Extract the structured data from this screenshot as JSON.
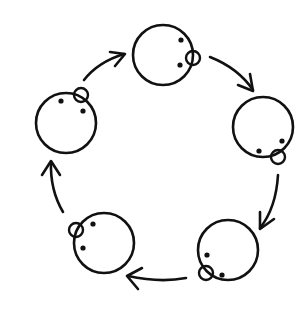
{
  "diagram": {
    "type": "cycle",
    "direction": "clockwise",
    "colors": {
      "stroke": "#111111",
      "background": "#ffffff"
    },
    "nodes": [
      {
        "id": "head-top",
        "cx": 163,
        "cy": 55,
        "r": 30,
        "bump": {
          "cx": 193,
          "cy": 58,
          "r": 7
        },
        "dots": [
          [
            181,
            40
          ],
          [
            180,
            65
          ]
        ]
      },
      {
        "id": "head-right",
        "cx": 263,
        "cy": 127,
        "r": 30,
        "bump": {
          "cx": 278,
          "cy": 157,
          "r": 7
        },
        "dots": [
          [
            259,
            151
          ],
          [
            282,
            141
          ]
        ]
      },
      {
        "id": "head-bottom-right",
        "cx": 228,
        "cy": 250,
        "r": 30,
        "bump": {
          "cx": 206,
          "cy": 273,
          "r": 7
        },
        "dots": [
          [
            207,
            255
          ],
          [
            222,
            275
          ]
        ]
      },
      {
        "id": "head-bottom-left",
        "cx": 104,
        "cy": 243,
        "r": 30,
        "bump": {
          "cx": 76,
          "cy": 230,
          "r": 7
        },
        "dots": [
          [
            93,
            224
          ],
          [
            83,
            248
          ]
        ]
      },
      {
        "id": "head-left",
        "cx": 66,
        "cy": 123,
        "r": 30,
        "bump": {
          "cx": 81,
          "cy": 95,
          "r": 7
        },
        "dots": [
          [
            61,
            101
          ],
          [
            83,
            111
          ]
        ]
      }
    ],
    "arrows": [
      {
        "id": "arrow-left-to-top",
        "path": "M84,80 Q98,62 124,54",
        "head": "M110,52 L125,54 L115,66"
      },
      {
        "id": "arrow-top-to-right",
        "path": "M210,57 Q238,68 253,90",
        "head": "M238,85 L253,91 L250,74"
      },
      {
        "id": "arrow-right-to-bottom-right",
        "path": "M278,175 Q276,208 260,228",
        "head": "M260,212 L260,229 L274,219"
      },
      {
        "id": "arrow-bottom-right-to-bottom-left",
        "path": "M186,278 Q160,283 128,276",
        "head": "M142,268 L127,276 L138,289"
      },
      {
        "id": "arrow-bottom-left-to-left",
        "path": "M63,212 Q50,190 51,162",
        "head": "M42,175 L51,161 L60,175"
      }
    ]
  }
}
